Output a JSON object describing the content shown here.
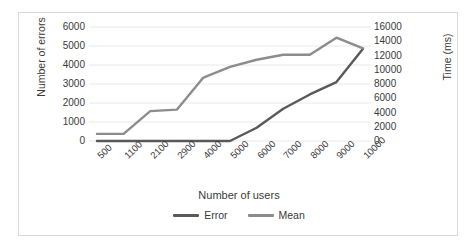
{
  "chart_data": {
    "type": "line",
    "title": "",
    "xlabel": "Number of users",
    "ylabel": "Number of errors",
    "y2label": "Time (ms)",
    "categories": [
      "500",
      "1100",
      "2100",
      "2900",
      "4000",
      "5000",
      "6000",
      "7000",
      "8000",
      "9000",
      "10000"
    ],
    "ylim": [
      0,
      6000
    ],
    "y2lim": [
      0,
      16000
    ],
    "yticks": [
      "6000",
      "5000",
      "4000",
      "3000",
      "2000",
      "1000",
      "0"
    ],
    "y2ticks": [
      "16000",
      "14000",
      "12000",
      "10000",
      "8000",
      "6000",
      "4000",
      "2000",
      "0"
    ],
    "grid": true,
    "legend_position": "bottom",
    "series": [
      {
        "name": "Error",
        "axis": "left",
        "color": "#595959",
        "values": [
          0,
          0,
          0,
          0,
          0,
          0,
          700,
          1700,
          2450,
          3100,
          4850
        ]
      },
      {
        "name": "Mean",
        "axis": "right",
        "color": "#8c8c8c",
        "values": [
          1000,
          1000,
          4200,
          4400,
          8900,
          10400,
          11400,
          12100,
          12100,
          14500,
          13000
        ]
      }
    ]
  },
  "legend": {
    "items": [
      {
        "label": "Error",
        "color": "#595959"
      },
      {
        "label": "Mean",
        "color": "#8c8c8c"
      }
    ]
  },
  "colors": {
    "error_series": "#595959",
    "mean_series": "#8c8c8c",
    "gridline": "#e8e8e8",
    "border": "#d9d9d9",
    "text": "#3a3a3a",
    "background": "#ffffff"
  }
}
